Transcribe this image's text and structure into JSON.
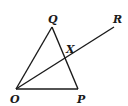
{
  "diagram": {
    "type": "geometry",
    "points": {
      "O": {
        "label": "O",
        "x": 16,
        "y": 89
      },
      "P": {
        "label": "P",
        "x": 78,
        "y": 89
      },
      "Q": {
        "label": "Q",
        "x": 52,
        "y": 27
      },
      "R": {
        "label": "R",
        "x": 114,
        "y": 27
      },
      "X": {
        "label": "X",
        "x": 65,
        "y": 58
      }
    },
    "segments": [
      [
        "O",
        "P"
      ],
      [
        "O",
        "Q"
      ],
      [
        "Q",
        "P"
      ],
      [
        "O",
        "R"
      ]
    ],
    "stroke_color": "#1a1a1a"
  }
}
